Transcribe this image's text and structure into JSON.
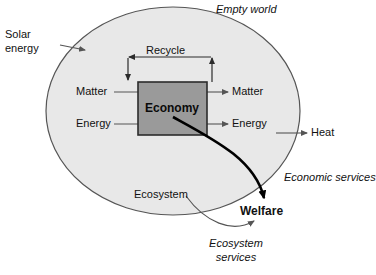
{
  "diagram": {
    "title": "Empty world",
    "world_shape": "ellipse",
    "colors": {
      "background": "#ffffff",
      "world_fill": "#e8e8e8",
      "world_stroke": "#555555",
      "economy_fill": "#9a9a9a",
      "economy_stroke": "#2b2b2b",
      "thin_arrow": "#555555",
      "thick_arrow": "#000000",
      "text": "#111111"
    },
    "nodes": {
      "economy": "Economy",
      "ecosystem": "Ecosystem",
      "welfare": "Welfare"
    },
    "inputs": {
      "solar_line1": "Solar",
      "solar_line2": "energy",
      "matter_in": "Matter",
      "energy_in": "Energy"
    },
    "outputs": {
      "matter_out": "Matter",
      "energy_out": "Energy",
      "heat": "Heat"
    },
    "loops": {
      "recycle": "Recycle"
    },
    "services": {
      "economic": "Economic services",
      "ecosystem_line1": "Ecosystem",
      "ecosystem_line2": "services"
    }
  }
}
